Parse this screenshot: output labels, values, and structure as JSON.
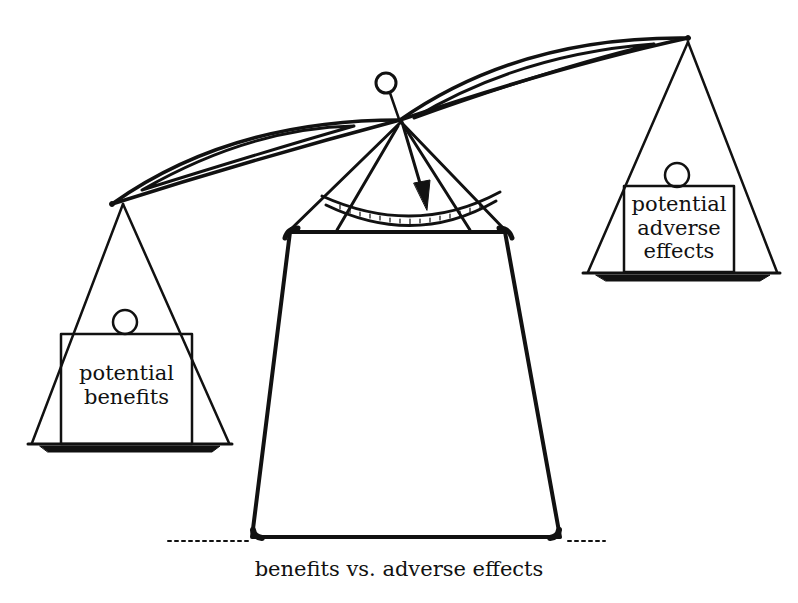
{
  "diagram": {
    "type": "balance-scale",
    "left_pan": {
      "label_lines": [
        "potential",
        "benefits"
      ],
      "position": "lower"
    },
    "right_pan": {
      "label_lines": [
        "potential",
        "adverse",
        "effects"
      ],
      "position": "higher"
    },
    "indicator": {
      "pointer": "arrow pointing down toward graduated arc scale",
      "tilt": "right side raised"
    },
    "caption": "benefits vs. adverse effects"
  },
  "colors": {
    "ink": "#111111",
    "background": "#ffffff"
  }
}
